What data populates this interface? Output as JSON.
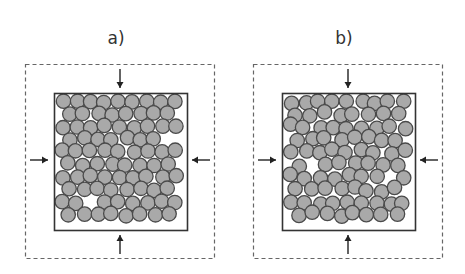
{
  "colors": {
    "particle_fill": "#a9a9a9",
    "particle_stroke": "#4a4a4a",
    "box_stroke": "#333333",
    "dashed_stroke": "#666666",
    "arrow": "#222222"
  },
  "panels": [
    {
      "label": "a)",
      "description": "Densely packed particles in a square container under compression from four sides",
      "arrows": [
        "down-from-top",
        "right-from-left",
        "left-from-right",
        "up-from-bottom"
      ]
    },
    {
      "label": "b)",
      "description": "Less ordered particle packing with visible voids in a square container under compression from four sides",
      "arrows": [
        "down-from-top",
        "right-from-left",
        "left-from-right",
        "up-from-bottom"
      ]
    }
  ]
}
